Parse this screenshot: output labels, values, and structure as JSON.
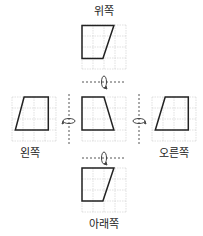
{
  "labels": {
    "top": "위쪽",
    "left": "왼쪽",
    "right": "오른쪽",
    "bottom": "아래쪽"
  },
  "figures": {
    "top": {
      "grid": [
        4,
        4
      ],
      "shape": [
        [
          0,
          0.05
        ],
        [
          2.9,
          0.05
        ],
        [
          1.9,
          3.05
        ],
        [
          0,
          3.05
        ]
      ]
    },
    "left": {
      "grid": [
        4,
        4
      ],
      "shape": [
        [
          1.1,
          0
        ],
        [
          3.3,
          0
        ],
        [
          3.3,
          3
        ],
        [
          0.3,
          3
        ]
      ]
    },
    "center": {
      "grid": [
        4,
        4
      ],
      "shape": [
        [
          0,
          0
        ],
        [
          2,
          0
        ],
        [
          2.9,
          3
        ],
        [
          0,
          3
        ]
      ]
    },
    "right": {
      "grid": [
        4,
        4
      ],
      "shape": [
        [
          1.2,
          0
        ],
        [
          3.3,
          0
        ],
        [
          3.3,
          3
        ],
        [
          0.3,
          3
        ]
      ]
    },
    "bottom": {
      "grid": [
        4,
        4
      ],
      "shape": [
        [
          0,
          0
        ],
        [
          2.9,
          0
        ],
        [
          1.9,
          3
        ],
        [
          0,
          3
        ]
      ]
    }
  },
  "colors": {
    "grid": "#cccccc",
    "shape": "#222222",
    "axis": "#555555"
  }
}
